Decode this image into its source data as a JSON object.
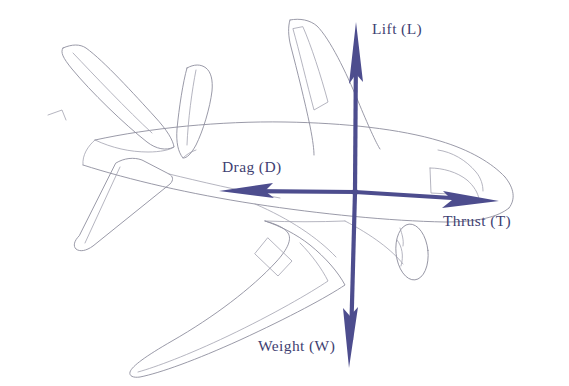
{
  "figure": {
    "title": "Four forces acting on an aircraft in flight",
    "background_color": "#ffffff",
    "outline_color": "#8f8f9e",
    "arrow_color": "#4d4d8e",
    "label_color": "#3f3f72"
  },
  "forces": {
    "lift": {
      "label": "Lift (L)",
      "symbol": "L",
      "name": "Lift",
      "direction": "up",
      "tail": {
        "x": 355,
        "y": 192
      },
      "tip": {
        "x": 356,
        "y": 22
      },
      "label_pos": {
        "x": 372,
        "y": 34
      }
    },
    "weight": {
      "label": "Weight (W)",
      "symbol": "W",
      "name": "Weight",
      "direction": "down",
      "tail": {
        "x": 355,
        "y": 192
      },
      "tip": {
        "x": 349,
        "y": 368
      },
      "label_pos": {
        "x": 258,
        "y": 351
      }
    },
    "drag": {
      "label": "Drag (D)",
      "symbol": "D",
      "name": "Drag",
      "direction": "left",
      "tail": {
        "x": 355,
        "y": 192
      },
      "tip": {
        "x": 219,
        "y": 191
      },
      "label_pos": {
        "x": 222,
        "y": 172
      }
    },
    "thrust": {
      "label": "Thrust (T)",
      "symbol": "T",
      "name": "Thrust",
      "direction": "right",
      "tail": {
        "x": 355,
        "y": 192
      },
      "tip": {
        "x": 499,
        "y": 201
      },
      "label_pos": {
        "x": 443,
        "y": 226
      }
    }
  },
  "aircraft_parts": [
    "fuselage",
    "nose",
    "cockpit-window",
    "vertical-stabilizer",
    "rudder",
    "horizontal-stabilizer-far",
    "horizontal-stabilizer-near",
    "wing-far",
    "wing-near",
    "aileron",
    "engine-nacelle"
  ],
  "center_of_gravity": {
    "x": 355,
    "y": 192
  }
}
